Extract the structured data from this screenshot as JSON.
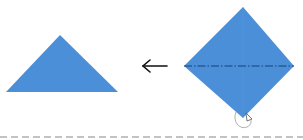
{
  "diagram": {
    "type": "origami-fold-step",
    "colors": {
      "paper": "#4a8fd8",
      "paper_light": "#5a9de0",
      "fold_line": "#1f3f6e",
      "arrow": "#111111",
      "separator": "#888888",
      "hand_arrow": "#9a9a9a"
    },
    "steps": [
      {
        "name": "result-triangle",
        "shape": "triangle"
      },
      {
        "name": "direction-arrow",
        "shape": "left-arrow"
      },
      {
        "name": "start-diamond",
        "shape": "diamond",
        "fold_line": "mountain-fold-horizontal"
      }
    ]
  }
}
